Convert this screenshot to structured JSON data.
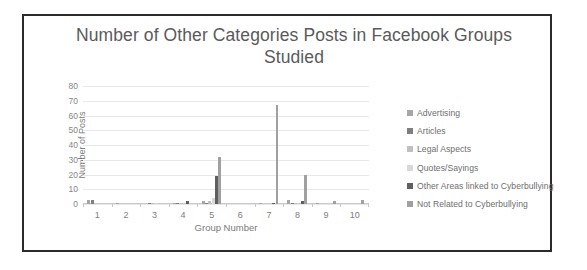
{
  "figure": {
    "border_color": "#2b2b2b",
    "background": "#ffffff"
  },
  "chart_data": {
    "type": "bar",
    "title": "Number of Other Categories Posts in Facebook Groups Studied",
    "xlabel": "Group Number",
    "ylabel": "Number of Posts",
    "ylim": [
      0,
      80
    ],
    "yticks": [
      80,
      70,
      60,
      50,
      40,
      30,
      20,
      10,
      0
    ],
    "grid": true,
    "legend_position": "right",
    "categories": [
      "1",
      "2",
      "3",
      "4",
      "5",
      "6",
      "7",
      "8",
      "9",
      "10"
    ],
    "series": [
      {
        "name": "Advertising",
        "color": "#a6a6a6",
        "values": [
          3,
          1,
          0,
          1,
          2,
          0,
          1,
          3,
          1,
          0
        ]
      },
      {
        "name": "Articles",
        "color": "#7f7f7f",
        "values": [
          3,
          0,
          1,
          1,
          1,
          0,
          0,
          1,
          0,
          0
        ]
      },
      {
        "name": "Legal Aspects",
        "color": "#bfbfbf",
        "values": [
          0,
          0,
          1,
          1,
          2,
          0,
          0,
          1,
          0,
          0
        ]
      },
      {
        "name": "Quotes/Sayings",
        "color": "#d9d9d9",
        "values": [
          0,
          0,
          1,
          0,
          4,
          0,
          0,
          0,
          0,
          0
        ]
      },
      {
        "name": "Other Areas linked to Cyberbullying",
        "color": "#5f5f5f",
        "values": [
          0,
          0,
          0,
          2,
          19,
          0,
          1,
          2,
          0,
          0
        ]
      },
      {
        "name": "Not Related to Cyberbullying",
        "color": "#a0a0a0",
        "values": [
          0,
          0,
          0,
          0,
          32,
          0,
          67,
          20,
          2,
          3
        ]
      }
    ]
  }
}
